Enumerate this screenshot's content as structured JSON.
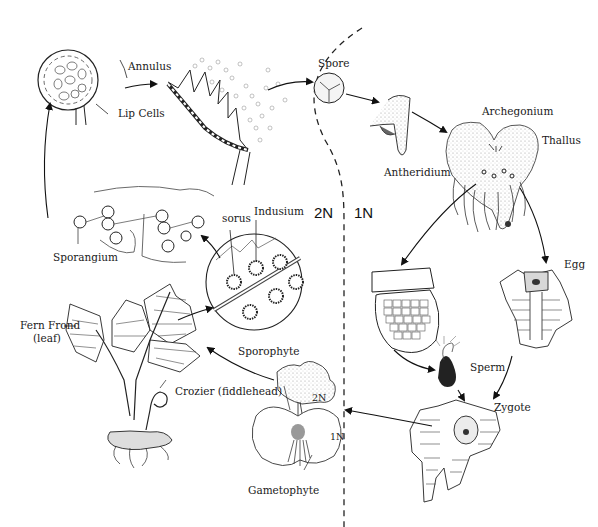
{
  "diagram": {
    "regions": {
      "diploid_label": "2N",
      "haploid_label": "1N"
    },
    "labels": {
      "annulus": "Annulus",
      "lip_cells": "Lip Cells",
      "spore": "Spore",
      "archegonium": "Archegonium",
      "thallus": "Thallus",
      "antheridium": "Antheridium",
      "sorus": "sorus",
      "indusium": "Indusium",
      "sporangium": "Sporangium",
      "egg": "Egg",
      "sperm": "Sperm",
      "zygote": "Zygote",
      "fern_frond": "Fern Frond",
      "fern_frond_sub": "(leaf)",
      "crozier": "Crozier (fiddlehead)",
      "sporophyte": "Sporophyte",
      "gametophyte": "Gametophyte",
      "young_sporophyte_2n": "2N",
      "young_gametophyte_1n": "1N"
    },
    "stages": [
      {
        "id": "sporangium-open",
        "label": "Lip Cells"
      },
      {
        "id": "annulus-release",
        "label": "Annulus"
      },
      {
        "id": "spore",
        "label": "Spore"
      },
      {
        "id": "germinating-spore",
        "label": ""
      },
      {
        "id": "thallus",
        "label": "Thallus"
      },
      {
        "id": "antheridium-detail",
        "label": "Antheridium"
      },
      {
        "id": "archegonium-detail",
        "label": "Egg"
      },
      {
        "id": "sperm",
        "label": "Sperm"
      },
      {
        "id": "zygote",
        "label": "Zygote"
      },
      {
        "id": "young-sporophyte",
        "label": "Sporophyte"
      },
      {
        "id": "mature-fern",
        "label": "Fern Frond"
      },
      {
        "id": "sori-closeup",
        "label": "sorus"
      },
      {
        "id": "sporangia-cluster",
        "label": "Sporangium"
      }
    ]
  }
}
